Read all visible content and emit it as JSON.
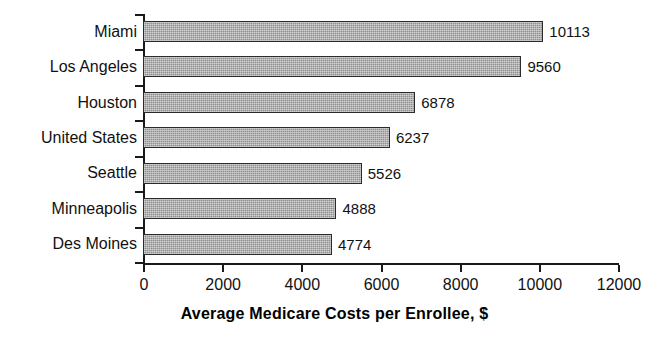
{
  "chart_data": {
    "type": "bar",
    "orientation": "horizontal",
    "title": "",
    "xlabel": "Average Medicare Costs per Enrollee, $",
    "ylabel": "",
    "xlim": [
      0,
      12000
    ],
    "xticks": [
      0,
      2000,
      4000,
      6000,
      8000,
      10000,
      12000
    ],
    "xtick_labels": [
      "0",
      "2000",
      "4000",
      "6000",
      "8000",
      "10000",
      "12000"
    ],
    "grid": false,
    "legend": false,
    "categories": [
      "Miami",
      "Los Angeles",
      "Houston",
      "United States",
      "Seattle",
      "Minneapolis",
      "Des Moines"
    ],
    "values": [
      10113,
      9560,
      6878,
      6237,
      5526,
      4888,
      4774
    ],
    "value_labels": [
      "10113",
      "9560",
      "6878",
      "6237",
      "5526",
      "4888",
      "4774"
    ],
    "bar_fill_color": "#8f8f8f",
    "bar_edge_color": "#2b2b2b",
    "axis_color": "#1a1a1a",
    "background_color": "#ffffff"
  }
}
